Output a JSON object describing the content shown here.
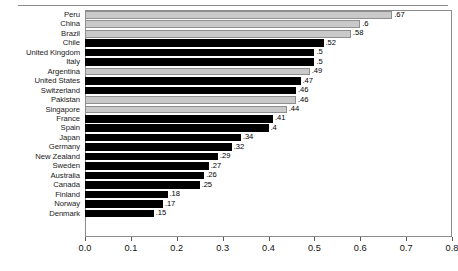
{
  "chart_data": {
    "type": "bar",
    "orientation": "horizontal",
    "title": "",
    "subtitle": "",
    "xlabel": "",
    "ylabel": "",
    "xlim": [
      0.0,
      0.8
    ],
    "ylim": null,
    "grid": false,
    "legend": null,
    "xticks": [
      "0.0",
      "0.1",
      "0.2",
      "0.3",
      "0.4",
      "0.5",
      "0.6",
      "0.7",
      "0.8"
    ],
    "xtick_values": [
      0.0,
      0.1,
      0.2,
      0.3,
      0.4,
      0.5,
      0.6,
      0.7,
      0.8
    ],
    "categories": [
      "Peru",
      "China",
      "Brazil",
      "Chile",
      "United Kingdom",
      "Italy",
      "Argentina",
      "United States",
      "Switzerland",
      "Pakistan",
      "Singapore",
      "France",
      "Spain",
      "Japan",
      "Germany",
      "New Zealand",
      "Sweden",
      "Australia",
      "Canada",
      "Finland",
      "Norway",
      "Denmark"
    ],
    "values": [
      0.67,
      0.6,
      0.58,
      0.52,
      0.5,
      0.5,
      0.49,
      0.47,
      0.46,
      0.46,
      0.44,
      0.41,
      0.4,
      0.34,
      0.32,
      0.29,
      0.27,
      0.26,
      0.25,
      0.18,
      0.17,
      0.15
    ],
    "data_labels": [
      ".67",
      ".6",
      ".58",
      ".52",
      ".5",
      ".5",
      ".49",
      ".47",
      ".46",
      ".46",
      ".44",
      ".41",
      ".4",
      ".34",
      ".32",
      ".29",
      ".27",
      ".26",
      ".25",
      ".18",
      ".17",
      ".15"
    ],
    "bar_styles": [
      "light",
      "light",
      "light",
      "dark",
      "dark",
      "dark",
      "light",
      "dark",
      "dark",
      "light",
      "light",
      "dark",
      "dark",
      "dark",
      "dark",
      "dark",
      "dark",
      "dark",
      "dark",
      "dark",
      "dark",
      "dark"
    ],
    "colors": {
      "light_bar": "#c9c9c9",
      "light_bar_edge": "#8f8f8f",
      "dark_bar": "#000000",
      "frame": "#8c8c8c",
      "text": "#111111",
      "background": "#ffffff"
    }
  }
}
